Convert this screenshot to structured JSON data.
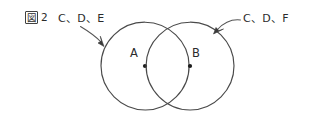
{
  "figure": {
    "caption_box_glyph": "図",
    "caption_number": "2",
    "caption_full": "図2"
  },
  "annotations": [
    {
      "id": "left-annotation",
      "text": "C、D、E",
      "points_to": "left-circle",
      "label_x": 58,
      "label_y": 22
    },
    {
      "id": "right-annotation",
      "text": "C、D、F",
      "points_to": "right-circle",
      "label_x": 243,
      "label_y": 22
    }
  ],
  "circles": [
    {
      "id": "left-circle",
      "center_label": "A",
      "cx": 145,
      "cy": 66,
      "r": 44,
      "label_x": 134,
      "label_y": 57
    },
    {
      "id": "right-circle",
      "center_label": "B",
      "cx": 190,
      "cy": 66,
      "r": 44,
      "label_x": 195,
      "label_y": 57
    }
  ],
  "colors": {
    "background": "#ffffff",
    "stroke": "#4a4a4a",
    "text": "#2b2b2b",
    "dot": "#1c1c1c"
  }
}
